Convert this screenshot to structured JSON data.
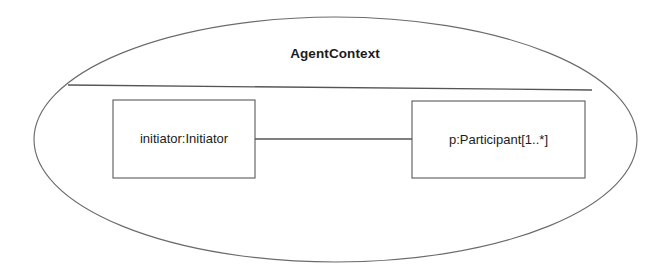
{
  "diagram": {
    "type": "uml-composite-structure",
    "container": {
      "name": "AgentContext",
      "shape": "ellipse",
      "bounds": {
        "cx": 335.5,
        "cy": 139.5,
        "rx": 301.5,
        "ry": 122.5
      }
    },
    "divider": {
      "name": "name-compartment-divider",
      "x1": 68,
      "y1": 85,
      "x2": 592,
      "y2": 90
    },
    "parts": [
      {
        "id": "initiator",
        "label": "initiator:Initiator",
        "role": "initiator",
        "class": "Initiator",
        "multiplicity": "",
        "bounds": {
          "x": 113,
          "y": 100,
          "width": 142,
          "height": 78
        }
      },
      {
        "id": "participant",
        "label": "p:Participant[1..*]",
        "role": "p",
        "class": "Participant",
        "multiplicity": "1..*",
        "bounds": {
          "x": 412,
          "y": 101,
          "width": 173,
          "height": 77
        }
      }
    ],
    "connector": {
      "name": "initiator-participant-connector",
      "from": "initiator",
      "to": "participant",
      "x1": 255,
      "y1": 139,
      "x2": 412,
      "y2": 139,
      "arrowheads": "none"
    },
    "colors": {
      "background": "#ffffff",
      "stroke": "#555555",
      "ellipse_stroke": "#6b6b6b",
      "text": "#1c1c1c"
    }
  }
}
